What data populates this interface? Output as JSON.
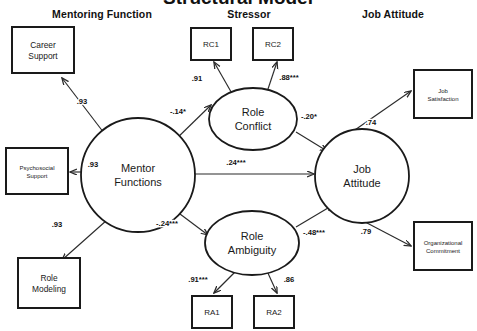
{
  "figure": {
    "title": "Structural Model",
    "title_note": "top of title is cropped off the top edge of the image",
    "background_color": "#ffffff",
    "line_color": "#2b2b2b",
    "text_color": "#1a1a1a"
  },
  "section_headers": [
    {
      "id": "mentoring-function",
      "label": "Mentoring Function",
      "x": 102,
      "y": 18
    },
    {
      "id": "stressor",
      "label": "Stressor",
      "x": 249,
      "y": 18
    },
    {
      "id": "job-attitude",
      "label": "Job Attitude",
      "x": 393,
      "y": 18
    }
  ],
  "nodes": {
    "observed": [
      {
        "id": "career-support",
        "label": "Career\nSupport",
        "x": 12,
        "y": 27,
        "w": 62,
        "h": 46,
        "font": "normal"
      },
      {
        "id": "psychosocial-support",
        "label": "Psychosocial\nSupport",
        "x": 6,
        "y": 148,
        "w": 62,
        "h": 46,
        "font": "small"
      },
      {
        "id": "role-modeling",
        "label": "Role\nModeling",
        "x": 18,
        "y": 258,
        "w": 62,
        "h": 50,
        "font": "normal"
      },
      {
        "id": "rc1",
        "label": "RC1",
        "x": 191,
        "y": 28,
        "w": 40,
        "h": 32,
        "font": "indicator"
      },
      {
        "id": "rc2",
        "label": "RC2",
        "x": 253,
        "y": 28,
        "w": 40,
        "h": 32,
        "font": "indicator"
      },
      {
        "id": "ra1",
        "label": "RA1",
        "x": 192,
        "y": 296,
        "w": 40,
        "h": 32,
        "font": "indicator"
      },
      {
        "id": "ra2",
        "label": "RA2",
        "x": 254,
        "y": 296,
        "w": 40,
        "h": 32,
        "font": "indicator"
      },
      {
        "id": "job-satisfaction",
        "label": "Job\nSatisfaction",
        "x": 414,
        "y": 70,
        "w": 58,
        "h": 48,
        "font": "small"
      },
      {
        "id": "organizational-commitment",
        "label": "Organizational\nCommitment",
        "x": 414,
        "y": 222,
        "w": 58,
        "h": 48,
        "font": "small"
      }
    ],
    "latent": [
      {
        "id": "mentor-functions",
        "label": "Mentor\nFunctions",
        "shape": "circle",
        "cx": 138,
        "cy": 175,
        "rx": 57,
        "ry": 57
      },
      {
        "id": "role-conflict",
        "label": "Role\nConflict",
        "shape": "ellipse",
        "cx": 253,
        "cy": 119,
        "rx": 44,
        "ry": 31
      },
      {
        "id": "role-ambiguity",
        "label": "Role\nAmbiguity",
        "shape": "ellipse",
        "cx": 252,
        "cy": 243,
        "rx": 47,
        "ry": 32
      },
      {
        "id": "job-attitude",
        "label": "Job\nAttitude",
        "shape": "circle",
        "cx": 362,
        "cy": 176,
        "rx": 47,
        "ry": 47
      }
    ]
  },
  "paths": [
    {
      "id": "mf-to-career-support",
      "from": "mentor-functions",
      "to": "career-support",
      "coefficient": ".93",
      "x1": 104,
      "y1": 133,
      "x2": 62,
      "y2": 78,
      "lx": 82,
      "ly": 104
    },
    {
      "id": "mf-to-psychosocial",
      "from": "mentor-functions",
      "to": "psychosocial-support",
      "coefficient": ".93",
      "x1": 81,
      "y1": 172,
      "x2": 70,
      "y2": 172,
      "lx": 93,
      "ly": 167
    },
    {
      "id": "mf-to-role-modeling",
      "from": "mentor-functions",
      "to": "role-modeling",
      "coefficient": ".93",
      "x1": 107,
      "y1": 220,
      "x2": 62,
      "y2": 260,
      "lx": 57,
      "ly": 227
    },
    {
      "id": "mf-to-role-conflict",
      "from": "mentor-functions",
      "to": "role-conflict",
      "coefficient": "-.14*",
      "x1": 172,
      "y1": 143,
      "x2": 211,
      "y2": 105,
      "lx": 178,
      "ly": 114
    },
    {
      "id": "mf-to-job-attitude",
      "from": "mentor-functions",
      "to": "job-attitude",
      "coefficient": ".24***",
      "x1": 195,
      "y1": 174,
      "x2": 314,
      "y2": 174,
      "lx": 236,
      "ly": 165
    },
    {
      "id": "mf-to-role-ambiguity",
      "from": "mentor-functions",
      "to": "role-ambiguity",
      "coefficient": "-.24***",
      "x1": 172,
      "y1": 208,
      "x2": 208,
      "y2": 235,
      "lx": 167,
      "ly": 226
    },
    {
      "id": "rc-to-rc1",
      "from": "role-conflict",
      "to": "rc1",
      "coefficient": ".91",
      "x1": 234,
      "y1": 97,
      "x2": 214,
      "y2": 62,
      "lx": 197,
      "ly": 81
    },
    {
      "id": "rc-to-rc2",
      "from": "role-conflict",
      "to": "rc2",
      "coefficient": ".88***",
      "x1": 266,
      "y1": 95,
      "x2": 277,
      "y2": 62,
      "lx": 289,
      "ly": 80
    },
    {
      "id": "rc-to-job-attitude",
      "from": "role-conflict",
      "to": "job-attitude",
      "coefficient": "-.20*",
      "x1": 296,
      "y1": 132,
      "x2": 327,
      "y2": 151,
      "lx": 309,
      "ly": 119
    },
    {
      "id": "ra-to-ra1",
      "from": "role-ambiguity",
      "to": "ra1",
      "coefficient": ".91***",
      "x1": 236,
      "y1": 271,
      "x2": 214,
      "y2": 293,
      "lx": 198,
      "ly": 282
    },
    {
      "id": "ra-to-ra2",
      "from": "role-ambiguity",
      "to": "ra2",
      "coefficient": ".86",
      "x1": 267,
      "y1": 271,
      "x2": 277,
      "y2": 293,
      "lx": 289,
      "ly": 282
    },
    {
      "id": "ra-to-job-attitude",
      "from": "role-ambiguity",
      "to": "job-attitude",
      "coefficient": "-.48***",
      "x1": 296,
      "y1": 227,
      "x2": 333,
      "y2": 205,
      "lx": 314,
      "ly": 235
    },
    {
      "id": "ja-to-job-satisfaction",
      "from": "job-attitude",
      "to": "job-satisfaction",
      "coefficient": ".74",
      "x1": 339,
      "y1": 141,
      "x2": 411,
      "y2": 91,
      "lx": 371,
      "ly": 125
    },
    {
      "id": "ja-to-org-commitment",
      "from": "job-attitude",
      "to": "organizational-commitment",
      "coefficient": ".79",
      "x1": 346,
      "y1": 212,
      "x2": 411,
      "y2": 246,
      "lx": 366,
      "ly": 234
    }
  ],
  "legend_note": {
    "significance": "* p < .05, *** p < .001"
  }
}
